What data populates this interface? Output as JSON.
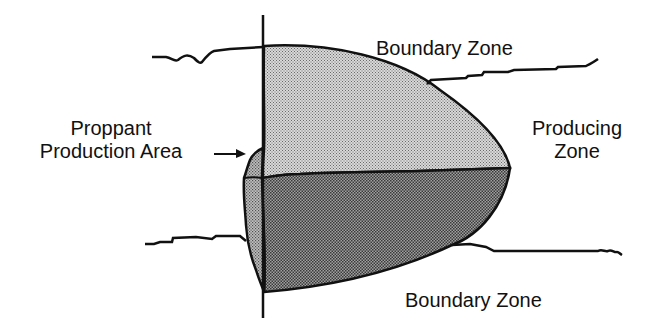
{
  "diagram": {
    "labels": {
      "boundary_zone_top": "Boundary Zone",
      "boundary_zone_bottom": "Boundary Zone",
      "producing_zone_line1": "Producing",
      "producing_zone_line2": "Zone",
      "proppant_line1": "Proppant",
      "proppant_line2": "Production Area"
    },
    "colors": {
      "line": "#111111",
      "upper_fill": "#c4c4c4",
      "lower_fill": "#8e8e8e",
      "proppant_fill": "#a8a8a8",
      "background": "#ffffff"
    },
    "elements": [
      "wellbore",
      "upper-boundary-line",
      "lower-boundary-line",
      "fracture-upper-half",
      "fracture-lower-half",
      "proppant-production-area",
      "arrow-to-proppant-area"
    ]
  }
}
